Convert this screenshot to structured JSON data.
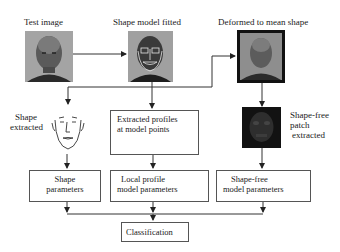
{
  "top": {
    "test_image": {
      "label": "Test image"
    },
    "shape_model": {
      "label": "Shape model fitted"
    },
    "deformed": {
      "label": "Deformed to mean shape"
    }
  },
  "middle": {
    "shape_extracted": {
      "line1": "Shape",
      "line2": "extracted"
    },
    "profiles_box": {
      "line1": "Extracted profiles",
      "line2": "at model points"
    },
    "patch": {
      "line1": "Shape-free",
      "line2": "patch",
      "line3": "extracted"
    }
  },
  "bottom": {
    "shape_params": {
      "line1": "Shape",
      "line2": "parameters"
    },
    "local_profile": {
      "line1": "Local profile",
      "line2": "model parameters"
    },
    "shape_free": {
      "line1": "Shape-free",
      "line2": "model parameters"
    },
    "classification": {
      "label": "Classification"
    }
  },
  "colors": {
    "line": "#333333",
    "box_border": "#555555",
    "photo_gray": "#8a8a8a",
    "photo_dark": "#1c1c1c"
  }
}
